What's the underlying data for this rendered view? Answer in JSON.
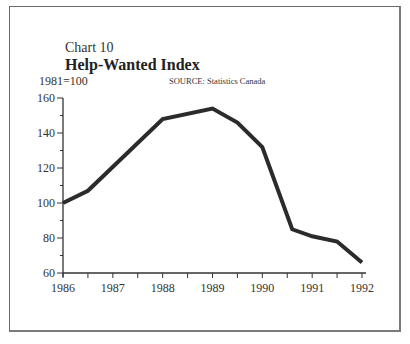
{
  "header": {
    "chart_number": "Chart 10",
    "title": "Help-Wanted Index",
    "unit": "1981=100",
    "source": "SOURCE:  Statistics Canada"
  },
  "axes": {
    "y_ticks": [
      "160",
      "140",
      "120",
      "100",
      "80",
      "60"
    ],
    "x_ticks": [
      "1986",
      "1987",
      "1988",
      "1989",
      "1990",
      "1991",
      "1992"
    ]
  },
  "colors": {
    "line": "#2b2b2b",
    "axis": "#333333",
    "frame": "#6a6a6a"
  },
  "chart_data": {
    "type": "line",
    "title": "Help-Wanted Index",
    "subtitle": "Chart 10",
    "unit_note": "1981=100",
    "source": "SOURCE: Statistics Canada",
    "xlabel": "",
    "ylabel": "",
    "xlim": [
      1986,
      1992
    ],
    "ylim": [
      60,
      160
    ],
    "y_ticks": [
      60,
      80,
      100,
      120,
      140,
      160
    ],
    "x_ticks": [
      1986,
      1987,
      1988,
      1989,
      1990,
      1991,
      1992
    ],
    "grid": false,
    "legend": null,
    "series": [
      {
        "name": "Help-Wanted Index",
        "x": [
          1986.0,
          1986.5,
          1988.0,
          1989.0,
          1989.5,
          1990.0,
          1990.6,
          1991.0,
          1991.5,
          1992.0
        ],
        "values": [
          100,
          107,
          148,
          154,
          146,
          132,
          85,
          81,
          78,
          66
        ]
      }
    ]
  }
}
